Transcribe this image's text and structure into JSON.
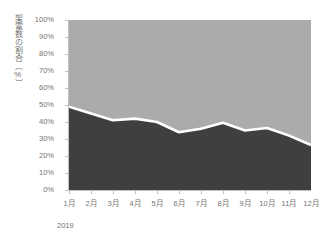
{
  "artifact": {
    "text": "・・・・・・"
  },
  "chart_data": {
    "type": "area",
    "stacked": true,
    "normalized_percent": true,
    "title": "",
    "subtitle": "",
    "xlabel": "2019",
    "ylabel": "架電数の割合（%）",
    "categories": [
      "1月",
      "2月",
      "3月",
      "4月",
      "5月",
      "6月",
      "7月",
      "8月",
      "9月",
      "10月",
      "11月",
      "12月"
    ],
    "ytick_labels": [
      "100%",
      "90%",
      "80%",
      "70%",
      "60%",
      "50%",
      "40%",
      "30%",
      "20%",
      "10%",
      "0%"
    ],
    "ytick_values": [
      100,
      90,
      80,
      70,
      60,
      50,
      40,
      30,
      20,
      10,
      0
    ],
    "ylim": [
      0,
      100
    ],
    "xlim_categories": 12,
    "grid": false,
    "legend": "none",
    "series": [
      {
        "name": "lower-area",
        "color": "#3f3f3f",
        "values": [
          49,
          45,
          41,
          42,
          40,
          34,
          36,
          39.5,
          35,
          36.5,
          32,
          26.5
        ]
      },
      {
        "name": "upper-area",
        "color": "#ababab",
        "values": [
          51,
          55,
          59,
          58,
          60,
          66,
          64,
          60.5,
          65,
          63.5,
          68,
          73.5
        ]
      }
    ],
    "boundary_line_color": "#ffffff",
    "axis_color": "#bfbfbf",
    "tick_text_color": "#757575"
  }
}
